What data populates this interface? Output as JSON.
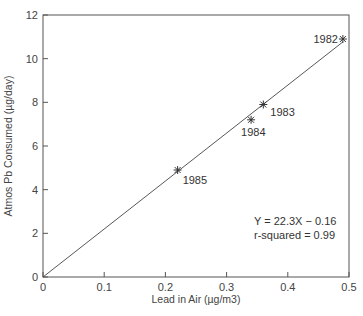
{
  "chart_data": {
    "type": "scatter",
    "title": "",
    "xlabel": "Lead in Air (µg/m3)",
    "ylabel": "Atmos Pb Consumed (µg/day)",
    "xlim": [
      0,
      0.5
    ],
    "ylim": [
      0,
      12
    ],
    "x_ticks": [
      0,
      0.1,
      0.2,
      0.3,
      0.4,
      0.5
    ],
    "x_tick_labels": [
      "0",
      "0.1",
      "0.2",
      "0.3",
      "0.4",
      "0.5"
    ],
    "y_ticks": [
      0,
      2,
      4,
      6,
      8,
      10,
      12
    ],
    "y_tick_labels": [
      "0",
      "2",
      "4",
      "6",
      "8",
      "10",
      "12"
    ],
    "grid": false,
    "legend": null,
    "marker": "asterisk",
    "series": [
      {
        "name": "Observed",
        "points": [
          {
            "label": "1982",
            "x": 0.49,
            "y": 10.9
          },
          {
            "label": "1983",
            "x": 0.36,
            "y": 7.9
          },
          {
            "label": "1984",
            "x": 0.34,
            "y": 7.2
          },
          {
            "label": "1985",
            "x": 0.22,
            "y": 4.9
          }
        ]
      }
    ],
    "fit_line": {
      "slope": 22.3,
      "intercept": -0.16,
      "x_range": [
        0,
        0.49
      ]
    },
    "annotations": {
      "equation": "Y = 22.3X − 0.16",
      "r_squared": "r-squared = 0.99"
    }
  }
}
